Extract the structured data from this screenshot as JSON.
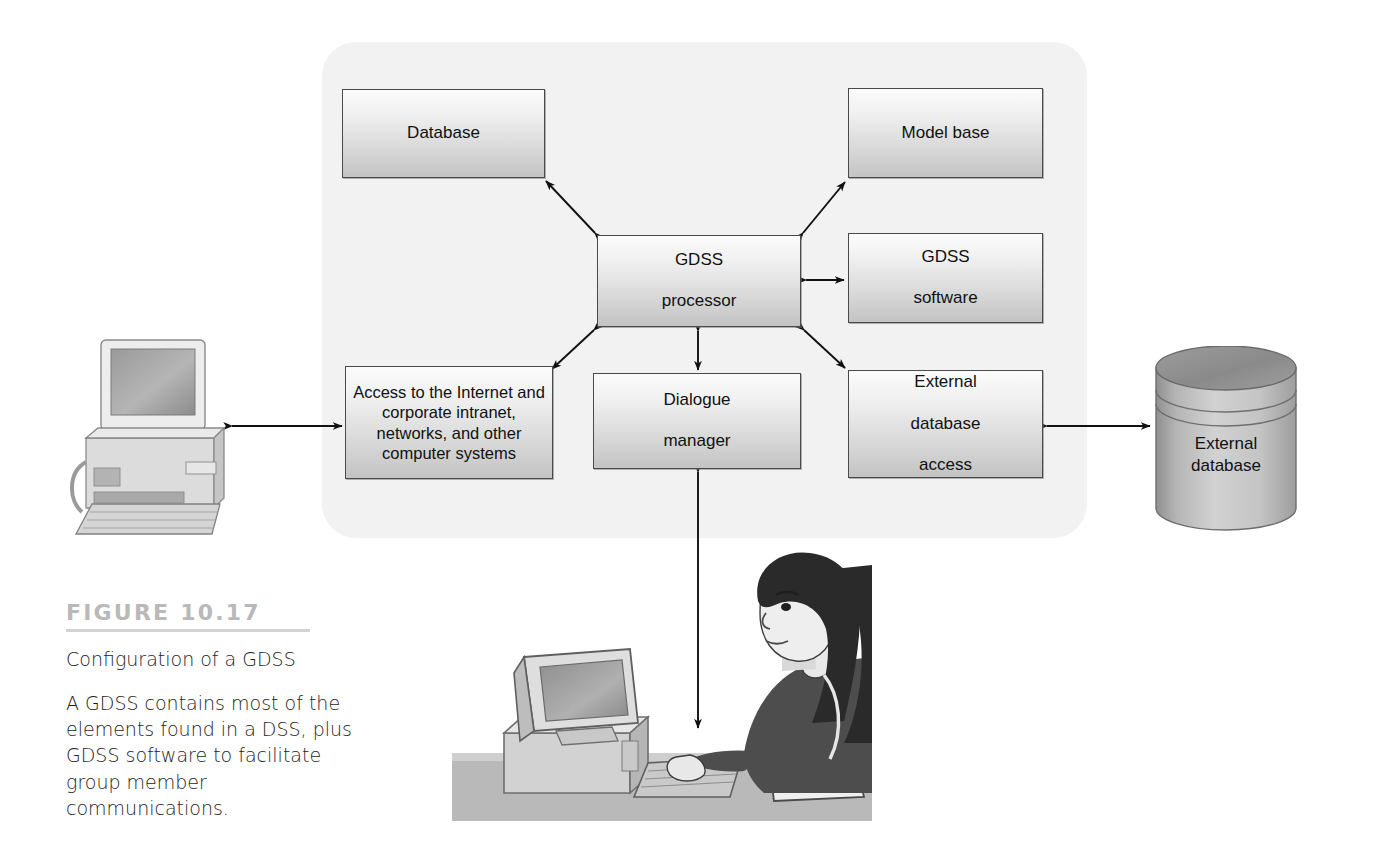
{
  "figure": {
    "number_label": "FIGURE 10.17",
    "title": "Configuration of a GDSS",
    "description": "A GDSS contains most of the elements found in a DSS, plus GDSS software to facilitate group member communications."
  },
  "diagram": {
    "type": "block-diagram",
    "panel_color": "#f2f2f2",
    "box_border_color": "#4a4a4a",
    "nodes": [
      {
        "id": "database",
        "label": "Database"
      },
      {
        "id": "model-base",
        "label": "Model base"
      },
      {
        "id": "gdss-processor",
        "label_line1": "GDSS",
        "label_line2": "processor"
      },
      {
        "id": "gdss-software",
        "label_line1": "GDSS",
        "label_line2": "software"
      },
      {
        "id": "access-internet",
        "label": "Access to the Internet and corporate intranet, networks, and other computer systems"
      },
      {
        "id": "dialogue-manager",
        "label_line1": "Dialogue",
        "label_line2": "manager"
      },
      {
        "id": "external-database-access",
        "label_line1": "External",
        "label_line2": "database",
        "label_line3": "access"
      },
      {
        "id": "external-database-cylinder",
        "label_line1": "External",
        "label_line2": "database"
      },
      {
        "id": "workstation-computer",
        "label": ""
      },
      {
        "id": "group-member-person",
        "label": ""
      }
    ],
    "edges": [
      {
        "from": "gdss-processor",
        "to": "database",
        "arrow": "both"
      },
      {
        "from": "gdss-processor",
        "to": "model-base",
        "arrow": "both"
      },
      {
        "from": "gdss-processor",
        "to": "gdss-software",
        "arrow": "both"
      },
      {
        "from": "gdss-processor",
        "to": "access-internet",
        "arrow": "both"
      },
      {
        "from": "gdss-processor",
        "to": "dialogue-manager",
        "arrow": "both"
      },
      {
        "from": "gdss-processor",
        "to": "external-database-access",
        "arrow": "both"
      },
      {
        "from": "workstation-computer",
        "to": "access-internet",
        "arrow": "both"
      },
      {
        "from": "external-database-access",
        "to": "external-database-cylinder",
        "arrow": "both"
      },
      {
        "from": "dialogue-manager",
        "to": "group-member-person",
        "arrow": "both"
      }
    ]
  }
}
